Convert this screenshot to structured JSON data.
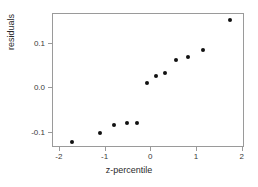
{
  "chart_data": {
    "type": "scatter",
    "title": "",
    "subtitle": "",
    "xlabel": "z-percentile",
    "ylabel": "residuals",
    "xlim": [
      -2.15,
      2.05
    ],
    "ylim": [
      -0.135,
      0.168
    ],
    "grid": false,
    "legend": null,
    "xticks": [
      -2,
      -1,
      0,
      1,
      2
    ],
    "xticklabels": [
      "-2",
      "-1",
      "0",
      "1",
      "2"
    ],
    "yticks": [
      0.1,
      0.0,
      -0.1
    ],
    "yticklabels": [
      "0.1",
      "0.0",
      "-0.1"
    ],
    "marker": "filled-circle",
    "marker_color": "#111111",
    "frame_color": "#9a9a9a",
    "background": "#ffffff",
    "n_points": 12,
    "x": [
      -1.73,
      -1.13,
      -0.81,
      -0.54,
      -0.31,
      -0.1,
      0.1,
      0.31,
      0.54,
      0.81,
      1.13,
      1.73
    ],
    "y": [
      -0.122,
      -0.1,
      -0.084,
      -0.078,
      -0.078,
      0.011,
      0.028,
      0.034,
      0.064,
      0.07,
      0.087,
      0.155
    ],
    "points": [
      {
        "x": -1.73,
        "y": -0.122
      },
      {
        "x": -1.13,
        "y": -0.1
      },
      {
        "x": -0.81,
        "y": -0.084
      },
      {
        "x": -0.54,
        "y": -0.078
      },
      {
        "x": -0.31,
        "y": -0.078
      },
      {
        "x": -0.1,
        "y": 0.011
      },
      {
        "x": 0.1,
        "y": 0.028
      },
      {
        "x": 0.31,
        "y": 0.034
      },
      {
        "x": 0.54,
        "y": 0.064
      },
      {
        "x": 0.81,
        "y": 0.07
      },
      {
        "x": 1.13,
        "y": 0.087
      },
      {
        "x": 1.73,
        "y": 0.155
      }
    ]
  }
}
